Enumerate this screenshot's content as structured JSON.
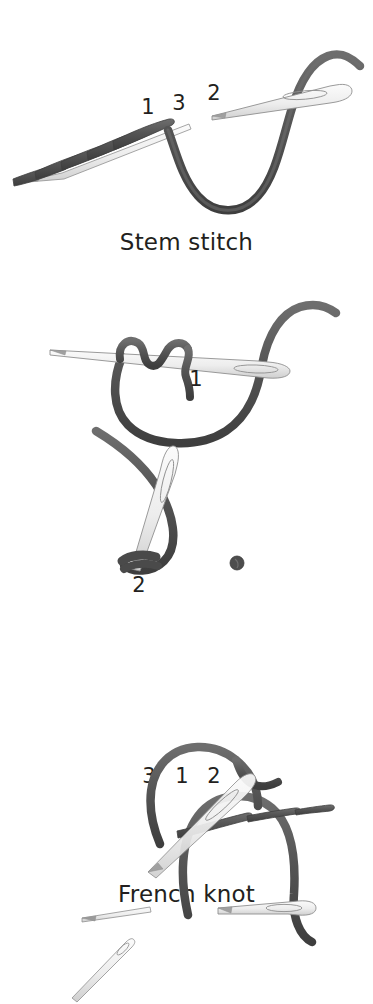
{
  "page": {
    "background_color": "#ffffff",
    "thread_color": "#5a5a5a",
    "thread_color_dark": "#4a4a4a",
    "needle_fill": "#f2f2f2",
    "needle_stroke": "#8a8a8a",
    "text_color": "#231f20"
  },
  "figures": [
    {
      "id": "stem-stitch",
      "caption": "Stem stitch",
      "step_labels": [
        {
          "text": "1",
          "x": 148,
          "y": 114
        },
        {
          "text": "3",
          "x": 179,
          "y": 110
        },
        {
          "text": "2",
          "x": 214,
          "y": 100
        }
      ],
      "elements": [
        "worked-stitch-row",
        "needle-in-fabric",
        "needle-with-thread",
        "curved-thread-loop"
      ]
    },
    {
      "id": "french-knot",
      "caption": "French knot",
      "step_labels": [
        {
          "text": "1",
          "x": 196,
          "y": 380
        },
        {
          "text": "2",
          "x": 139,
          "y": 580
        }
      ],
      "elements": [
        "horizontal-needle",
        "thread-wrapped-twice",
        "thread-loop-below",
        "vertical-needle",
        "thread-wrap-at-tip",
        "finished-knot-dot"
      ],
      "finished_knot": {
        "x": 237,
        "y": 563,
        "r": 7
      }
    },
    {
      "id": "backstitch",
      "caption": "Backstitch",
      "step_labels": [
        {
          "text": "3",
          "x": 149,
          "y": 783
        },
        {
          "text": "1",
          "x": 182,
          "y": 783
        },
        {
          "text": "2",
          "x": 214,
          "y": 783
        }
      ],
      "elements": [
        "bare-needle-left",
        "arched-thread-loop",
        "needle-with-thread",
        "second-stage-arch",
        "completed-stitch-segments",
        "small-needle-icon"
      ]
    }
  ]
}
